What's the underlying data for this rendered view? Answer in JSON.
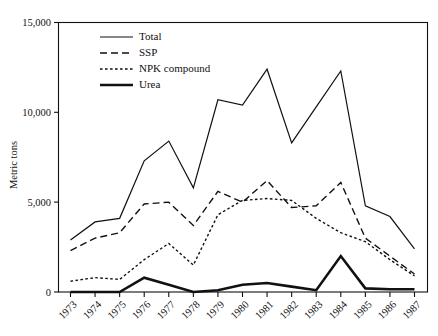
{
  "chart_data": {
    "type": "line",
    "title": "",
    "xlabel": "",
    "ylabel": "Metric tons",
    "ylim": [
      0,
      15000
    ],
    "yticks": [
      0,
      5000,
      10000,
      15000
    ],
    "ytick_labels": [
      "0",
      "5,000",
      "10,000",
      "15,000"
    ],
    "grid": false,
    "legend_position": "top-left-inside",
    "categories": [
      "1973",
      "1974",
      "1975",
      "1976",
      "1977",
      "1978",
      "1979",
      "1980",
      "1981",
      "1982",
      "1983",
      "1984",
      "1985",
      "1986",
      "1987"
    ],
    "x": [
      1973,
      1974,
      1975,
      1976,
      1977,
      1978,
      1979,
      1980,
      1981,
      1982,
      1983,
      1984,
      1985,
      1986,
      1987
    ],
    "series": [
      {
        "name": "Total",
        "style": "solid-thin",
        "values": [
          2900,
          3900,
          4100,
          7300,
          8400,
          5800,
          10700,
          10400,
          12400,
          8300,
          10300,
          12300,
          4800,
          4200,
          2400
        ]
      },
      {
        "name": "SSP",
        "style": "dashed-long",
        "values": [
          2300,
          3000,
          3300,
          4900,
          5000,
          3700,
          5600,
          5000,
          6200,
          4700,
          4800,
          6100,
          3000,
          2000,
          1000
        ]
      },
      {
        "name": "NPK compound",
        "style": "dotted",
        "values": [
          600,
          800,
          700,
          1800,
          2700,
          1500,
          4300,
          5100,
          5200,
          5100,
          4100,
          3300,
          2800,
          1800,
          900
        ]
      },
      {
        "name": "Urea",
        "style": "solid-thick",
        "values": [
          0,
          0,
          0,
          800,
          400,
          0,
          100,
          400,
          500,
          300,
          100,
          2000,
          200,
          150,
          150
        ]
      }
    ]
  },
  "axis": {
    "y_title": "Metric tons",
    "y_tick_labels": [
      "15,000",
      "10,000",
      "5,000",
      "0"
    ],
    "x_tick_labels": [
      "1973",
      "1974",
      "1975",
      "1976",
      "1977",
      "1978",
      "1979",
      "1980",
      "1981",
      "1982",
      "1983",
      "1984",
      "1985",
      "1986",
      "1987"
    ]
  },
  "legend": {
    "items": [
      {
        "label": "Total",
        "style": "solid-thin"
      },
      {
        "label": "SSP",
        "style": "dashed-long"
      },
      {
        "label": "NPK compound",
        "style": "dotted"
      },
      {
        "label": "Urea",
        "style": "solid-thick"
      }
    ]
  },
  "colors": {
    "ink": "#111111",
    "background": "#ffffff"
  }
}
